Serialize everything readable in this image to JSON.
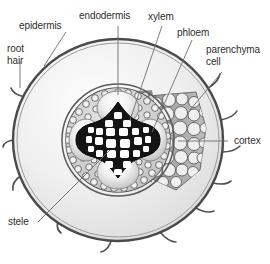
{
  "diagram": {
    "background_color": "#ffffff",
    "text_color": "#2e2e2e",
    "labels": {
      "epidermis": "epidermis",
      "root_hair": "root\nhair",
      "endodermis": "endodermis",
      "xylem": "xylem",
      "phloem": "phloem",
      "parenchyma_cell": "parenchyma\ncell",
      "cortex": "cortex",
      "stele": "stele"
    },
    "structures": {
      "epidermis_outline_color": "#4a4a4a",
      "cortex_fill_color": "#ececec",
      "cortex_cells_fill_color": "#a8a8a8",
      "endodermis_ring_color": "#5a5a5a",
      "xylem_fill_color": "#1a1a1a",
      "phloem_fill_color": "#e8e8e8",
      "stele_fill_color": "#d4d4d4",
      "leader_line_color": "#6e6e6e",
      "root_hair_count": 9
    }
  }
}
